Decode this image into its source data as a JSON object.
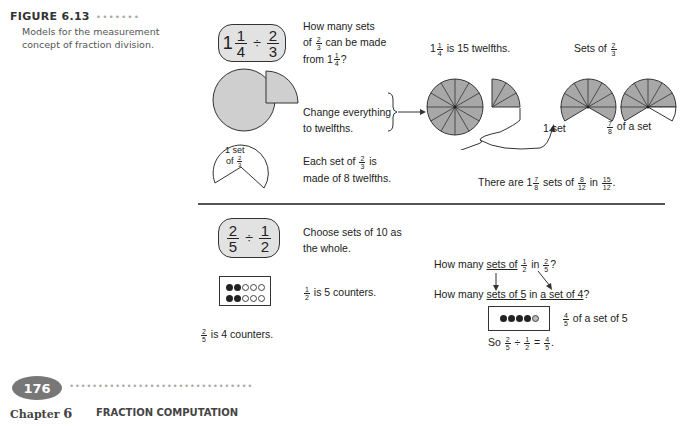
{
  "figure": {
    "label": "FIGURE 6.13",
    "dots": "•••••••",
    "caption": "Models for the measurement concept of fraction division."
  },
  "problem1": {
    "expression": {
      "whole": "1",
      "a_num": "1",
      "a_den": "4",
      "op": "÷",
      "b_num": "2",
      "b_den": "3"
    },
    "question": {
      "line1": "How many sets",
      "line2_pre": "of",
      "line2_num": "2",
      "line2_den": "3",
      "line2_post": "can be made",
      "line3_pre": "from 1",
      "line3_num": "1",
      "line3_den": "4",
      "line3_post": "?"
    },
    "step2": {
      "line1": "Change everything",
      "line2": "to twelfths."
    },
    "twelfths_label": {
      "pre": "1",
      "num": "1",
      "den": "4",
      "post": "is 15 twelfths."
    },
    "sets_label": {
      "pre": "Sets of",
      "num": "2",
      "den": "3"
    },
    "one_set_label": "1 set",
    "seven_eighths_label": {
      "num": "7",
      "den": "8",
      "post": "of a set"
    },
    "set_shape_label": {
      "line1": "1 set",
      "line2_pre": "of",
      "num": "2",
      "den": "3"
    },
    "step3": {
      "line1_pre": "Each set of",
      "num": "2",
      "den": "3",
      "line1_post": "is",
      "line2": "made of 8 twelfths."
    },
    "conclusion": {
      "pre": "There are 1",
      "a_num": "7",
      "a_den": "8",
      "mid": "sets of",
      "b_num": "8",
      "b_den": "12",
      "mid2": "in",
      "c_num": "15",
      "c_den": "12",
      "post": "."
    }
  },
  "problem2": {
    "expression": {
      "a_num": "2",
      "a_den": "5",
      "op": "÷",
      "b_num": "1",
      "b_den": "2"
    },
    "step1": {
      "line1": "Choose sets of 10 as",
      "line2": "the whole."
    },
    "half_label": {
      "num": "1",
      "den": "2",
      "post": "is 5 counters."
    },
    "two_fifths_label": {
      "num": "2",
      "den": "5",
      "post": "is 4 counters."
    },
    "q1": {
      "pre": "How many",
      "ul": "sets of",
      "num": "1",
      "den": "2",
      "mid": "in",
      "num2": "2",
      "den2": "5",
      "post": "?"
    },
    "q2": {
      "pre": "How many",
      "ul1": "sets of 5",
      "mid": "in",
      "ul2": "a set of 4",
      "post": "?"
    },
    "result_label": {
      "num": "4",
      "den": "5",
      "post": "of a set of 5"
    },
    "final": {
      "pre": "So",
      "a_num": "2",
      "a_den": "5",
      "op": "÷",
      "b_num": "1",
      "b_den": "2",
      "eq": "=",
      "c_num": "4",
      "c_den": "5",
      "post": "."
    }
  },
  "footer": {
    "page_number": "176",
    "dots": "••••••••••••••••••••••••••••••••",
    "chapter_word": "Chapter",
    "chapter_number": "6",
    "chapter_title": "FRACTION COMPUTATION"
  },
  "colors": {
    "shade": "#a8a8a8",
    "pill": "#e2e2e2",
    "badge": "#777777"
  }
}
